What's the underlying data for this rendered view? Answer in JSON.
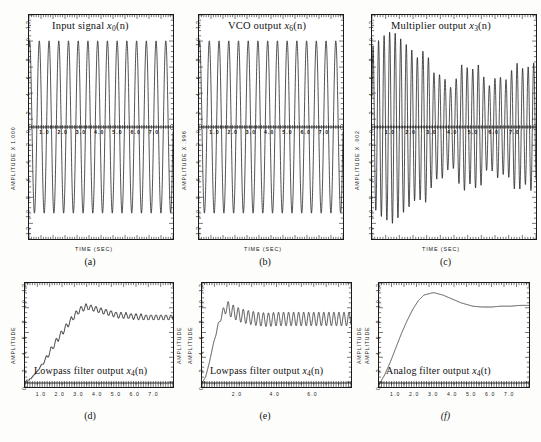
{
  "figure": {
    "panels": [
      {
        "id": "a",
        "caption": "(a)",
        "title": "Input signal",
        "title_sym": "x",
        "title_sub": "0",
        "title_arg": "(n)",
        "ylabel": "AMPLITUDE  X  1.000",
        "ylabel_right": "AMPLITUDE",
        "xlabel": "TIME  (SEC)",
        "yticks": [
          "1.2",
          "1.0",
          ".8",
          ".6",
          ".4",
          ".2",
          "0",
          "-.2",
          "-.4",
          "-.6",
          "-.8",
          "-1.0",
          "-1.2"
        ],
        "xticks": [
          "1.0",
          "2.0",
          "3.0",
          "4.0",
          "5.0",
          "6.0",
          "7.0"
        ],
        "ylim": [
          -1.3,
          1.3
        ],
        "xlim": [
          0,
          8
        ]
      },
      {
        "id": "b",
        "caption": "(b)",
        "title": "VCO output",
        "title_sym": "x",
        "title_sub": "6",
        "title_arg": "(n)",
        "ylabel": "AMPLITUDE  X  .996",
        "ylabel_right": "AMPLITUDE",
        "xlabel": "TIME  (SEC)",
        "yticks": [
          "1.2",
          "1.0",
          ".8",
          ".6",
          ".4",
          ".2",
          "0",
          "-.2",
          "-.4",
          "-.6",
          "-.8",
          "-1.0",
          "-1.2"
        ],
        "xticks": [
          "1.0",
          "2.0",
          "3.0",
          "4.0",
          "5.0",
          "6.0",
          "7.0"
        ],
        "ylim": [
          -1.3,
          1.3
        ],
        "xlim": [
          0,
          8
        ]
      },
      {
        "id": "c",
        "caption": "(c)",
        "title": "Multiplier output",
        "title_sym": "x",
        "title_sub": "3",
        "title_arg": "(n)",
        "ylabel": "AMPLITUDE  X  .002",
        "ylabel_right": "AMPLITUDE",
        "xlabel": "TIME  (SEC)",
        "yticks": [
          "1.2",
          "1.0",
          ".8",
          ".6",
          ".4",
          ".2",
          "0",
          "-.2",
          "-.4",
          "-.6",
          "-.8",
          "-1.0",
          "-1.2"
        ],
        "xticks": [
          "1.0",
          "2.0",
          "3.0",
          "4.0",
          "5.0",
          "6.0",
          "7.0"
        ],
        "ylim": [
          -1.3,
          1.3
        ],
        "xlim": [
          0,
          8
        ]
      },
      {
        "id": "d",
        "caption": "(d)",
        "title": "Lowpass filter output",
        "title_sym": "x",
        "title_sub": "4",
        "title_arg": "(n)",
        "ylabel": "AMPLITUDE",
        "ylabel_right": "AMPLITUDE",
        "xlabel": "",
        "yticks": [
          "1.2",
          "1.0",
          ".8",
          ".6",
          ".4",
          ".2",
          "0"
        ],
        "xticks": [
          "1.0",
          "2.0",
          "3.0",
          "4.0",
          "5.0",
          "6.0",
          "7.0"
        ],
        "ylim": [
          -0.05,
          1.25
        ],
        "xlim": [
          0,
          8
        ]
      },
      {
        "id": "e",
        "caption": "(e)",
        "title": "Lowpass filter output",
        "title_sym": "x",
        "title_sub": "4",
        "title_arg": "(n)",
        "ylabel": "AMPLITUDE",
        "ylabel_right": "AMPLITUDE",
        "xlabel": "",
        "yticks": [
          "1.2",
          "1.0",
          ".8",
          ".6",
          ".4",
          ".2",
          "0"
        ],
        "xticks": [
          "2.0",
          "4.0",
          "6.0"
        ],
        "ylim": [
          -0.05,
          1.25
        ],
        "xlim": [
          0,
          8
        ]
      },
      {
        "id": "f",
        "caption": "(f)",
        "title": "Analog filter output",
        "title_sym": "x",
        "title_sub": "4",
        "title_arg": "(t)",
        "title_italic": true,
        "ylabel": "AMPLITUDE",
        "ylabel_right": "",
        "xlabel": "",
        "yticks": [
          "1.2",
          "1.0",
          ".8",
          ".6",
          ".4",
          ".2",
          "0"
        ],
        "xticks": [
          "1.0",
          "2.0",
          "3.0",
          "4.0",
          "5.0",
          "6.0",
          "7.0"
        ],
        "ylim": [
          -0.05,
          1.25
        ],
        "xlim": [
          0,
          8
        ]
      }
    ]
  },
  "chart_data": [
    {
      "id": "a",
      "type": "line",
      "title": "Input signal x0(n)",
      "xlabel": "TIME (SEC)",
      "ylabel": "AMPLITUDE X 1.000",
      "xlim": [
        0,
        8
      ],
      "ylim": [
        -1.3,
        1.3
      ],
      "grid": false,
      "description": "Sinusoidal input carrier, constant unit amplitude, approximately 1.8 Hz, 15 visible cycles across 8 seconds",
      "waveform": "sine",
      "frequency_hz": 1.85,
      "amplitude": 1.0,
      "offset": 0.0,
      "n_cycles": 15
    },
    {
      "id": "b",
      "type": "line",
      "title": "VCO output x6(n)",
      "xlabel": "TIME (SEC)",
      "ylabel": "AMPLITUDE X .996",
      "xlim": [
        0,
        8
      ],
      "ylim": [
        -1.3,
        1.3
      ],
      "grid": false,
      "description": "Voltage controlled oscillator output, constant unit amplitude sinusoid locked near input frequency",
      "waveform": "sine",
      "frequency_hz": 1.85,
      "amplitude": 1.0,
      "offset": 0.0,
      "n_cycles": 15
    },
    {
      "id": "c",
      "type": "line",
      "title": "Multiplier output x3(n)",
      "xlabel": "TIME (SEC)",
      "ylabel": "AMPLITUDE X .002",
      "xlim": [
        0,
        8
      ],
      "ylim": [
        -1.3,
        1.3
      ],
      "grid": false,
      "description": "Product of input and VCO: double-frequency carrier with decaying then settling envelope; large at start, reduced and irregular after t=2.5",
      "waveform": "modulated-sine",
      "carrier_frequency_hz": 3.7,
      "envelope_points": [
        {
          "t": 0.0,
          "a": 0.92
        },
        {
          "t": 0.5,
          "a": 1.05
        },
        {
          "t": 1.0,
          "a": 1.12
        },
        {
          "t": 1.5,
          "a": 1.0
        },
        {
          "t": 2.0,
          "a": 0.88
        },
        {
          "t": 2.5,
          "a": 0.74
        },
        {
          "t": 3.0,
          "a": 0.64
        },
        {
          "t": 3.5,
          "a": 0.58
        },
        {
          "t": 4.0,
          "a": 0.63
        },
        {
          "t": 4.5,
          "a": 0.68
        },
        {
          "t": 5.0,
          "a": 0.6
        },
        {
          "t": 5.5,
          "a": 0.55
        },
        {
          "t": 6.0,
          "a": 0.62
        },
        {
          "t": 6.5,
          "a": 0.66
        },
        {
          "t": 7.0,
          "a": 0.6
        },
        {
          "t": 7.5,
          "a": 0.64
        },
        {
          "t": 8.0,
          "a": 0.7
        }
      ]
    },
    {
      "id": "d",
      "type": "line",
      "title": "Lowpass filter output x4(n)",
      "xlabel": "",
      "ylabel": "AMPLITUDE",
      "xlim": [
        0,
        8
      ],
      "ylim": [
        -0.05,
        1.25
      ],
      "grid": false,
      "description": "Step-like staircase rise from 0 to about 0.95 by t=3.2, small ripple thereafter settling near 0.82",
      "step_response_points": [
        {
          "t": 0.0,
          "y": 0.02
        },
        {
          "t": 0.3,
          "y": 0.05
        },
        {
          "t": 0.6,
          "y": 0.13
        },
        {
          "t": 0.9,
          "y": 0.22
        },
        {
          "t": 1.2,
          "y": 0.33
        },
        {
          "t": 1.5,
          "y": 0.45
        },
        {
          "t": 1.8,
          "y": 0.56
        },
        {
          "t": 2.1,
          "y": 0.66
        },
        {
          "t": 2.4,
          "y": 0.76
        },
        {
          "t": 2.7,
          "y": 0.85
        },
        {
          "t": 3.0,
          "y": 0.92
        },
        {
          "t": 3.3,
          "y": 0.95
        },
        {
          "t": 3.6,
          "y": 0.94
        },
        {
          "t": 4.0,
          "y": 0.91
        },
        {
          "t": 4.5,
          "y": 0.88
        },
        {
          "t": 5.0,
          "y": 0.85
        },
        {
          "t": 5.5,
          "y": 0.84
        },
        {
          "t": 6.0,
          "y": 0.83
        },
        {
          "t": 6.5,
          "y": 0.82
        },
        {
          "t": 7.0,
          "y": 0.82
        },
        {
          "t": 7.5,
          "y": 0.82
        },
        {
          "t": 8.0,
          "y": 0.82
        }
      ],
      "ripple_amplitude": 0.035
    },
    {
      "id": "e",
      "type": "line",
      "title": "Lowpass filter output x4(n)",
      "xlabel": "",
      "ylabel": "AMPLITUDE",
      "xlim": [
        0,
        8
      ],
      "ylim": [
        -0.05,
        1.25
      ],
      "grid": false,
      "description": "Fast rise to peak 0.98 near t=1.3, then larger sustained ripple around mean 0.80",
      "step_response_points": [
        {
          "t": 0.0,
          "y": 0.0
        },
        {
          "t": 0.2,
          "y": 0.08
        },
        {
          "t": 0.4,
          "y": 0.26
        },
        {
          "t": 0.6,
          "y": 0.48
        },
        {
          "t": 0.8,
          "y": 0.66
        },
        {
          "t": 1.0,
          "y": 0.82
        },
        {
          "t": 1.3,
          "y": 0.95
        },
        {
          "t": 1.6,
          "y": 0.9
        },
        {
          "t": 2.0,
          "y": 0.85
        },
        {
          "t": 2.5,
          "y": 0.82
        },
        {
          "t": 3.0,
          "y": 0.8
        },
        {
          "t": 3.5,
          "y": 0.79
        },
        {
          "t": 4.0,
          "y": 0.8
        },
        {
          "t": 5.0,
          "y": 0.8
        },
        {
          "t": 6.0,
          "y": 0.8
        },
        {
          "t": 7.0,
          "y": 0.8
        },
        {
          "t": 8.0,
          "y": 0.8
        }
      ],
      "ripple_amplitude": 0.085
    },
    {
      "id": "f",
      "type": "line",
      "title": "Analog filter output x4(t)",
      "xlabel": "",
      "ylabel": "AMPLITUDE",
      "xlim": [
        0,
        8
      ],
      "ylim": [
        -0.05,
        1.25
      ],
      "grid": false,
      "description": "Smooth second-order step response, overshoot peak 1.13 at t=2.9, settles to 0.97 after t=5.5",
      "step_response_points": [
        {
          "t": 0.0,
          "y": -0.02
        },
        {
          "t": 0.3,
          "y": 0.1
        },
        {
          "t": 0.6,
          "y": 0.26
        },
        {
          "t": 0.9,
          "y": 0.44
        },
        {
          "t": 1.2,
          "y": 0.62
        },
        {
          "t": 1.5,
          "y": 0.78
        },
        {
          "t": 1.8,
          "y": 0.92
        },
        {
          "t": 2.1,
          "y": 1.03
        },
        {
          "t": 2.4,
          "y": 1.1
        },
        {
          "t": 2.9,
          "y": 1.13
        },
        {
          "t": 3.4,
          "y": 1.1
        },
        {
          "t": 3.9,
          "y": 1.05
        },
        {
          "t": 4.4,
          "y": 1.0
        },
        {
          "t": 5.0,
          "y": 0.96
        },
        {
          "t": 5.5,
          "y": 0.95
        },
        {
          "t": 6.0,
          "y": 0.95
        },
        {
          "t": 6.5,
          "y": 0.96
        },
        {
          "t": 7.0,
          "y": 0.96
        },
        {
          "t": 7.5,
          "y": 0.97
        },
        {
          "t": 8.0,
          "y": 0.97
        }
      ],
      "ripple_amplitude": 0.0
    }
  ]
}
